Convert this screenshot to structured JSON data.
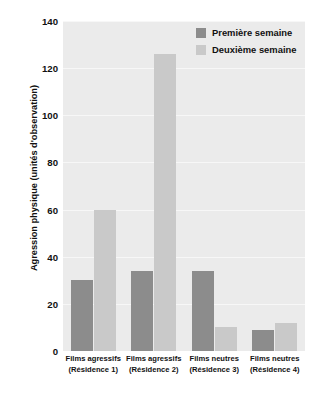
{
  "chart_data": {
    "type": "bar",
    "title": "",
    "xlabel": "",
    "ylabel": "Agression physique (unités d'observation)",
    "ylim": [
      0,
      140
    ],
    "yticks": [
      0,
      20,
      40,
      60,
      80,
      100,
      120,
      140
    ],
    "grid": true,
    "legend_position": "top-right",
    "categories": [
      "Films agressifs (Résidence 1)",
      "Films agressifs (Résidence 2)",
      "Films neutres (Résidence 3)",
      "Films neutres (Résidence 4)"
    ],
    "category_lines": [
      {
        "line1": "Films agressifs",
        "line2": "(Résidence 1)"
      },
      {
        "line1": "Films agressifs",
        "line2": "(Résidence 2)"
      },
      {
        "line1": "Films neutres",
        "line2": "(Résidence 3)"
      },
      {
        "line1": "Films neutres",
        "line2": "(Résidence 4)"
      }
    ],
    "series": [
      {
        "name": "Première semaine",
        "color": "#8c8c8c",
        "values": [
          30,
          34,
          34,
          9
        ]
      },
      {
        "name": "Deuxième semaine",
        "color": "#c9c9c9",
        "values": [
          60,
          126,
          10,
          12
        ]
      }
    ]
  },
  "colors": {
    "plot_background": "#ebebeb",
    "gridline": "#f7f7f7",
    "page_background": "#ffffff",
    "text": "#111111"
  }
}
